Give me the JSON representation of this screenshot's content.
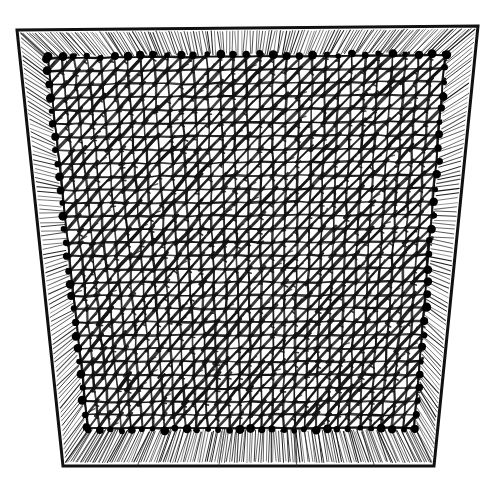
{
  "image": {
    "kind": "line-art-engraving",
    "subject": "knotted netting stretched on a wooden frame",
    "alt_text": "Black and white engraving of a square net of knotted mesh stretched taut inside a trapezoidal wooden frame, fastened with rows of nails around all four edges.",
    "width": 483,
    "height": 485,
    "background_color": "#ffffff",
    "ink_color": "#141414"
  },
  "frame": {
    "name": "wooden-stretcher-frame",
    "shape": "trapezoid",
    "outer_corners": {
      "top_left": [
        17,
        30
      ],
      "top_right": [
        478,
        26
      ],
      "bottom_right": [
        434,
        466
      ],
      "bottom_left": [
        63,
        466
      ]
    },
    "inner_corners": {
      "top_left": [
        48,
        58
      ],
      "top_right": [
        445,
        55
      ],
      "bottom_right": [
        414,
        428
      ],
      "bottom_left": [
        88,
        428
      ]
    },
    "border_color": "#111111",
    "border_width_px": 3,
    "rails": [
      {
        "name": "top-rail",
        "hatching": "vertical",
        "stroke_count": 150
      },
      {
        "name": "right-rail",
        "hatching": "horizontal",
        "stroke_count": 95
      },
      {
        "name": "bottom-rail",
        "hatching": "vertical",
        "stroke_count": 150
      },
      {
        "name": "left-rail",
        "hatching": "horizontal",
        "stroke_count": 95
      }
    ]
  },
  "mesh": {
    "name": "knotted-net",
    "cell_size_px": 13.2,
    "columns": 30,
    "rows": 28,
    "line_color": "#121212",
    "line_width_px": 2.0,
    "knot_diagonal": true,
    "knot_diagonal_width_px": 2.6,
    "description": "Square grid of warp and weft cords with a diagonal knot stroke in every cell"
  },
  "nails": {
    "name": "perimeter-nails",
    "color": "#000000",
    "radius_px": 3.4,
    "spacing_px": 13.2,
    "count_top": 30,
    "count_bottom": 30,
    "count_left": 28,
    "count_right": 28,
    "description": "Round headed tacks holding the net edge to the frame rails"
  },
  "labels": {
    "title": "Netting stretched on a frame",
    "figure_note": ""
  }
}
